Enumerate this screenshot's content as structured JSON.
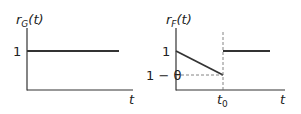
{
  "panels": [
    {
      "id": "left",
      "ylabel_main": "r",
      "ylabel_sub": "G",
      "ylabel_arg": "(t)",
      "xlabel": "t",
      "y_tick": "1"
    },
    {
      "id": "right",
      "ylabel_main": "r",
      "ylabel_sub": "F",
      "ylabel_arg": "(t)",
      "xlabel": "t",
      "y_tick_top": "1",
      "y_tick_low": "1 − θ",
      "x_tick_main": "t",
      "x_tick_sub": "0"
    }
  ],
  "colors": {
    "line": "#333333",
    "dash": "#666666"
  }
}
